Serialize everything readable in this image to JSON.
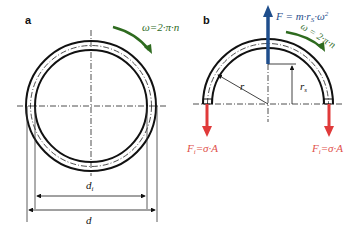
{
  "panels": {
    "a": {
      "label": "a",
      "omega_label": "ω=2·π·n",
      "inner_diameter_label": "d",
      "inner_diameter_sub": "i",
      "outer_diameter_label": "d"
    },
    "b": {
      "label": "b",
      "force_label": "F = m·r",
      "force_sub": "S",
      "force_tail": "·ω",
      "force_sup": "2",
      "omega_label": "ω = 2·π·n",
      "radius_label": "r",
      "rs_label": "r",
      "rs_sub": "s",
      "left_force_label": "F",
      "left_force_sub": "i",
      "left_force_tail": "=σ·A",
      "right_force_label": "F",
      "right_force_sub": "i",
      "right_force_tail": "=σ·A"
    }
  },
  "colors": {
    "ring": "#111111",
    "omega_arrow": "#2e6b1f",
    "force_up": "#1f4e8c",
    "force_down": "#e03a3a",
    "force_down_text": "#e0504a"
  }
}
